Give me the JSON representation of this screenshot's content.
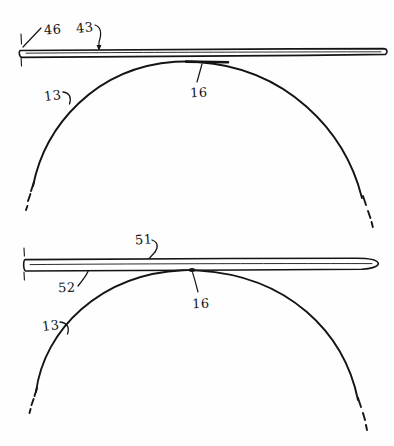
{
  "figure": {
    "kind": "patent-line-drawing",
    "background_color": "#fefefe",
    "ink_color": "#141414",
    "width": 394,
    "height": 446
  },
  "top_figure": {
    "name": "upper-diagram",
    "labels": [
      {
        "id": "label-46",
        "text": "46",
        "x": 44,
        "y": 22
      },
      {
        "id": "label-43",
        "text": "43",
        "x": 76,
        "y": 20
      },
      {
        "id": "label-16-top",
        "text": "16",
        "x": 190,
        "y": 85
      },
      {
        "id": "label-13-top",
        "text": "13",
        "x": 44,
        "y": 88
      }
    ],
    "parts": {
      "bar": "elongated-strip-46-43",
      "arc": "curved-surface-13",
      "contact_segment": "contact-zone-16"
    }
  },
  "bottom_figure": {
    "name": "lower-diagram",
    "labels": [
      {
        "id": "label-51",
        "text": "51",
        "x": 135,
        "y": 232
      },
      {
        "id": "label-52",
        "text": "52",
        "x": 58,
        "y": 280
      },
      {
        "id": "label-16-bottom",
        "text": "16",
        "x": 192,
        "y": 296
      },
      {
        "id": "label-13-bottom",
        "text": "13",
        "x": 42,
        "y": 318
      }
    ],
    "parts": {
      "bar": "elongated-strip-51-52",
      "arc": "curved-surface-13",
      "contact_point": "contact-point-16"
    }
  }
}
